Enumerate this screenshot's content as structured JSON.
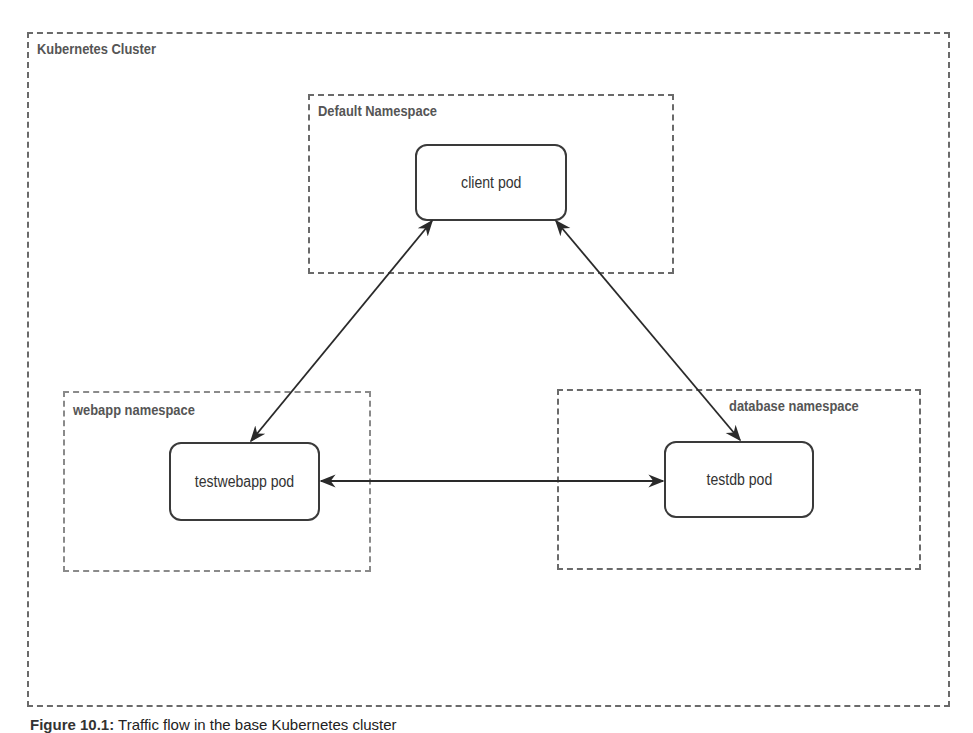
{
  "cluster": {
    "label": "Kubernetes Cluster"
  },
  "namespaces": [
    {
      "id": "default",
      "label": "Default Namespace",
      "pod": "client pod"
    },
    {
      "id": "webapp",
      "label": "webapp namespace",
      "pod": "testwebapp pod"
    },
    {
      "id": "database",
      "label": "database namespace",
      "pod": "testdb pod"
    }
  ],
  "connections": [
    {
      "from": "client pod",
      "to": "testwebapp pod",
      "direction": "bidirectional"
    },
    {
      "from": "client pod",
      "to": "testdb pod",
      "direction": "bidirectional"
    },
    {
      "from": "testwebapp pod",
      "to": "testdb pod",
      "direction": "bidirectional"
    }
  ],
  "caption": {
    "prefix": "Figure 10.1:",
    "text": "Traffic flow in the base Kubernetes cluster"
  }
}
